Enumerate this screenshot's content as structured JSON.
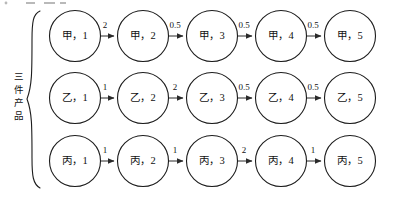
{
  "figure": {
    "side_label": "三件产品",
    "side_label_chars": [
      "三",
      "件",
      "产",
      "品"
    ],
    "brace": "left-curly-brace",
    "node_separator": "，"
  },
  "rows": [
    {
      "product": "甲",
      "nodes": [
        {
          "label": "甲，1",
          "stage": "1"
        },
        {
          "label": "甲，2",
          "stage": "2"
        },
        {
          "label": "甲，3",
          "stage": "3"
        },
        {
          "label": "甲，4",
          "stage": "4"
        },
        {
          "label": "甲，5",
          "stage": "5"
        }
      ],
      "edges": [
        "2",
        "0.5",
        "0.5",
        "0.5"
      ]
    },
    {
      "product": "乙",
      "nodes": [
        {
          "label": "乙，1",
          "stage": "1"
        },
        {
          "label": "乙，2",
          "stage": "2"
        },
        {
          "label": "乙，3",
          "stage": "3"
        },
        {
          "label": "乙，4",
          "stage": "4"
        },
        {
          "label": "乙，5",
          "stage": "5"
        }
      ],
      "edges": [
        "1",
        "2",
        "0.5",
        "0.5"
      ]
    },
    {
      "product": "丙",
      "nodes": [
        {
          "label": "丙，1",
          "stage": "1"
        },
        {
          "label": "丙，2",
          "stage": "2"
        },
        {
          "label": "丙，3",
          "stage": "3"
        },
        {
          "label": "丙，4",
          "stage": "4"
        },
        {
          "label": "丙，5",
          "stage": "5"
        }
      ],
      "edges": [
        "1",
        "1",
        "2",
        "1"
      ]
    }
  ],
  "colors": {
    "stroke": "#1c1c1c",
    "text": "#111111",
    "background": "#ffffff"
  }
}
